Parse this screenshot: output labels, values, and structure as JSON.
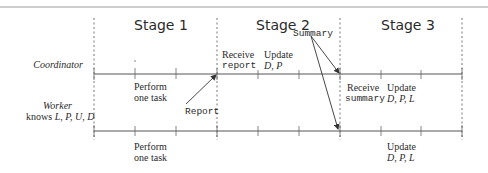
{
  "stages": [
    {
      "label": "Stage 1"
    },
    {
      "label": "Stage 2"
    },
    {
      "label": "Stage 3"
    }
  ],
  "rows": {
    "coordinator": {
      "label": "Coordinator"
    },
    "worker": {
      "label": "Worker",
      "knows_prefix": "knows ",
      "knows_vars": "L, P, U, D"
    }
  },
  "coordinator_events": {
    "stage2_receive": {
      "line1": "Receive",
      "line2": "report"
    },
    "stage2_update": {
      "line1": "Update",
      "line2": "D, P"
    },
    "stage3_receive": {
      "line1": "Receive",
      "line2": "summary"
    },
    "stage3_update": {
      "line1": "Update",
      "line2": "D, P, L"
    }
  },
  "worker_events": {
    "stage1_perform_above": {
      "line1": "Perform",
      "line2": "one task"
    },
    "stage1_perform_below": {
      "line1": "Perform",
      "line2": "one task"
    },
    "stage3_update_below": {
      "line1": "Update",
      "line2": "D, P, L"
    }
  },
  "messages": {
    "report": "Report",
    "summary": "Summary"
  },
  "colors": {
    "line": "#555555",
    "text": "#2a2a2a",
    "rule": "#888888"
  }
}
